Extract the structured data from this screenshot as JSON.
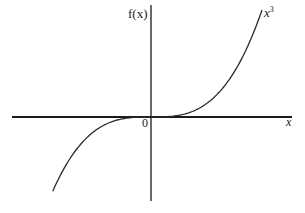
{
  "figure": {
    "y_axis_label": "f(x)",
    "x_axis_label": "x",
    "origin_label": "0",
    "curve_label_base": "x",
    "curve_label_exponent": "3"
  },
  "chart_data": {
    "type": "line",
    "title": "",
    "xlabel": "x",
    "ylabel": "f(x)",
    "function": "f(x) = x^3",
    "grid": false,
    "legend": "none",
    "annotations": [
      "x^3",
      "0"
    ],
    "series": [
      {
        "name": "x^3",
        "x": [
          -1.0,
          -0.8,
          -0.6,
          -0.4,
          -0.2,
          0,
          0.2,
          0.4,
          0.6,
          0.8,
          1.0
        ],
        "values": [
          -1.0,
          -0.512,
          -0.216,
          -0.064,
          -0.008,
          0,
          0.008,
          0.064,
          0.216,
          0.512,
          1.0
        ]
      }
    ],
    "colors": {
      "axis": "#1a1a1a",
      "curve": "#2a2a2a",
      "background": "#ffffff"
    }
  }
}
